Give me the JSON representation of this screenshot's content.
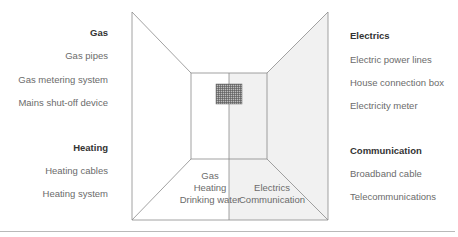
{
  "groups": {
    "gas": {
      "title": "Gas",
      "items": [
        "Gas pipes",
        "Gas metering system",
        "Mains shut-off device"
      ]
    },
    "heating": {
      "title": "Heating",
      "items": [
        "Heating cables",
        "Heating system"
      ]
    },
    "electrics": {
      "title": "Electrics",
      "items": [
        "Electric power lines",
        "House connection box",
        "Electricity meter"
      ]
    },
    "communication": {
      "title": "Communication",
      "items": [
        "Broadband cable",
        "Telecommunications"
      ]
    }
  },
  "floor_zones": {
    "left": [
      "Gas",
      "Heating",
      "Drinking water"
    ],
    "right": [
      "Electrics",
      "Communication"
    ]
  },
  "colors": {
    "line": "#8a8a8a",
    "shade": "#f1f1f1",
    "meter": "#7a7a7a",
    "heading_text": "#333333",
    "item_text": "#6b6b6b"
  }
}
